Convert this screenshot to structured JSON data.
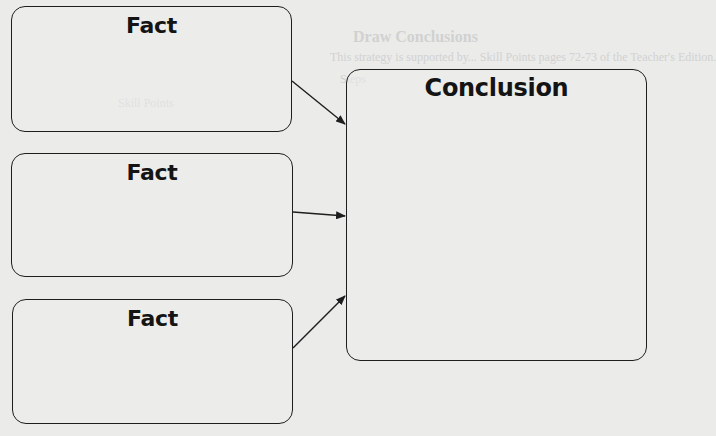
{
  "diagram": {
    "type": "facts-to-conclusion",
    "facts": [
      {
        "label": "Fact"
      },
      {
        "label": "Fact"
      },
      {
        "label": "Fact"
      }
    ],
    "conclusion": {
      "label": "Conclusion"
    },
    "arrows": [
      {
        "from": "fact-1",
        "to": "conclusion"
      },
      {
        "from": "fact-2",
        "to": "conclusion"
      },
      {
        "from": "fact-3",
        "to": "conclusion"
      }
    ]
  },
  "background": {
    "heading": "Draw Conclusions",
    "lines": [
      "This strategy is supported by... Skill Points pages 72-73 of the Teacher's Edition.",
      "Steps",
      "Skill Points"
    ]
  },
  "colors": {
    "page_background": "#ebebea",
    "stroke": "#1e1e1e",
    "text": "#141414"
  }
}
